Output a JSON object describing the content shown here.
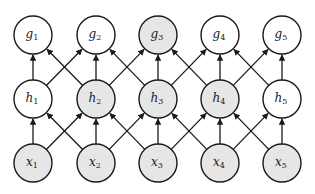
{
  "diagram": {
    "colors": {
      "observed_fill": "#e6e6e6",
      "hidden_fill": "#ffffff",
      "stroke": "#1a1a1a"
    },
    "layout": {
      "columns_x": [
        33,
        96,
        158,
        220,
        282
      ],
      "rows_y": {
        "g": 35,
        "h": 99,
        "x": 163
      },
      "radius": 19
    },
    "rows": [
      {
        "id": "g",
        "nodes": [
          {
            "name": "g",
            "sub": "1",
            "shaded": false
          },
          {
            "name": "g",
            "sub": "2",
            "shaded": false
          },
          {
            "name": "g",
            "sub": "3",
            "shaded": true
          },
          {
            "name": "g",
            "sub": "4",
            "shaded": false
          },
          {
            "name": "g",
            "sub": "5",
            "shaded": false
          }
        ]
      },
      {
        "id": "h",
        "nodes": [
          {
            "name": "h",
            "sub": "1",
            "shaded": false
          },
          {
            "name": "h",
            "sub": "2",
            "shaded": true
          },
          {
            "name": "h",
            "sub": "3",
            "shaded": true
          },
          {
            "name": "h",
            "sub": "4",
            "shaded": true
          },
          {
            "name": "h",
            "sub": "5",
            "shaded": false
          }
        ]
      },
      {
        "id": "x",
        "nodes": [
          {
            "name": "x",
            "sub": "1",
            "shaded": true
          },
          {
            "name": "x",
            "sub": "2",
            "shaded": true
          },
          {
            "name": "x",
            "sub": "3",
            "shaded": true
          },
          {
            "name": "x",
            "sub": "4",
            "shaded": true
          },
          {
            "name": "x",
            "sub": "5",
            "shaded": true
          }
        ]
      }
    ],
    "edges_description": "Each node in a lower row points (arrow) to the node directly above and to the immediate left/right neighbours in the row above: x_i -> h_{i-1}, h_i, h_{i+1}; h_i -> g_{i-1}, g_i, g_{i+1}."
  }
}
